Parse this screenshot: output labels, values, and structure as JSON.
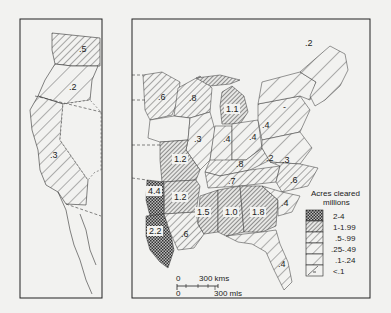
{
  "legend": {
    "title": "Acres cleared",
    "subtitle": "millions",
    "items": [
      {
        "label": "2-4",
        "pattern": "crosshatch"
      },
      {
        "label": "1-1.99",
        "pattern": "dense-hatch"
      },
      {
        "label": ".5-.99",
        "pattern": "medium-hatch"
      },
      {
        "label": ".25-.49",
        "pattern": "sparse-hatch"
      },
      {
        "label": ".1-.24",
        "pattern": "very-sparse-hatch"
      },
      {
        "label": "<.1",
        "pattern": "dash"
      }
    ]
  },
  "scale": {
    "kms_zero": "0",
    "kms_label": "300 kms",
    "mls_zero": "0",
    "mls_label": "300 mls"
  },
  "west_panel": {
    "regions": [
      {
        "name": "washington",
        "value": ".5"
      },
      {
        "name": "oregon",
        "value": ".2"
      },
      {
        "name": "california",
        "value": ".3"
      }
    ]
  },
  "east_panel": {
    "regions": [
      {
        "name": "minnesota",
        "value": ".6"
      },
      {
        "name": "wisconsin",
        "value": ".8"
      },
      {
        "name": "michigan",
        "value": "1.1"
      },
      {
        "name": "illinois",
        "value": ".3"
      },
      {
        "name": "indiana",
        "value": ".4"
      },
      {
        "name": "ohio",
        "value": ".4"
      },
      {
        "name": "new-york",
        "value": ".2"
      },
      {
        "name": "maine",
        "value": ".2"
      },
      {
        "name": "pennsylvania",
        "value": ".4"
      },
      {
        "name": "missouri",
        "value": "1.2"
      },
      {
        "name": "kentucky",
        "value": ".8"
      },
      {
        "name": "virginia-west",
        "value": ".2"
      },
      {
        "name": "virginia-east",
        "value": ".3"
      },
      {
        "name": "tennessee",
        "value": ".7"
      },
      {
        "name": "north-carolina",
        "value": ".6"
      },
      {
        "name": "arkansas",
        "value": "1.2"
      },
      {
        "name": "texas-north",
        "value": "4.4"
      },
      {
        "name": "texas-south",
        "value": "2.2"
      },
      {
        "name": "louisiana",
        "value": ".6"
      },
      {
        "name": "mississippi",
        "value": "1.5"
      },
      {
        "name": "alabama",
        "value": "1.0"
      },
      {
        "name": "georgia",
        "value": "1.8"
      },
      {
        "name": "south-carolina",
        "value": ".4"
      },
      {
        "name": "florida",
        "value": ".4"
      },
      {
        "name": "new-england-small",
        "value": "-"
      }
    ]
  }
}
